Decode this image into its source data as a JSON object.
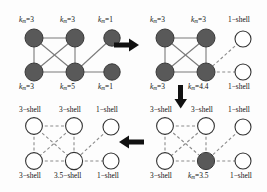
{
  "figure": {
    "width": 267,
    "height": 192,
    "colors": {
      "node_filled": "#595959",
      "node_open_fill": "#ffffff",
      "node_stroke": "#333333",
      "edge_solid": "#7a7a7a",
      "edge_dashed": "#8c8c8c",
      "arrow": "#111111",
      "text": "#111111",
      "background": "#fdfdfd"
    }
  },
  "panels": [
    {
      "id": "panel-top-left",
      "position": "top-left",
      "nodes": [
        {
          "id": "tl-n1",
          "pos": "top-left",
          "state": "filled",
          "label": "k_m=3",
          "label_side": "above"
        },
        {
          "id": "tl-n2",
          "pos": "top-middle",
          "state": "filled",
          "label": "k_m=3",
          "label_side": "above"
        },
        {
          "id": "tl-n3",
          "pos": "top-right",
          "state": "filled",
          "label": "k_m=1",
          "label_side": "above"
        },
        {
          "id": "tl-n4",
          "pos": "bottom-left",
          "state": "filled",
          "label": "k_m=3",
          "label_side": "below"
        },
        {
          "id": "tl-n5",
          "pos": "bottom-middle",
          "state": "filled",
          "label": "k_m=5",
          "label_side": "below"
        },
        {
          "id": "tl-n6",
          "pos": "bottom-right",
          "state": "filled",
          "label": "k_m=1",
          "label_side": "below"
        }
      ],
      "labels": {
        "top_left": "k",
        "top_left_sub": "m",
        "top_left_val": "=3",
        "top_mid": "k",
        "top_mid_sub": "m",
        "top_mid_val": "=3",
        "top_right": "k",
        "top_right_sub": "m",
        "top_right_val": "=1",
        "bot_left": "k",
        "bot_left_sub": "m",
        "bot_left_val": "=3",
        "bot_mid": "k",
        "bot_mid_sub": "m",
        "bot_mid_val": "=5",
        "bot_right": "k",
        "bot_right_sub": "m",
        "bot_right_val": "=1"
      },
      "edges": [
        [
          "tl-n1",
          "tl-n2",
          "solid"
        ],
        [
          "tl-n1",
          "tl-n4",
          "solid"
        ],
        [
          "tl-n1",
          "tl-n5",
          "solid"
        ],
        [
          "tl-n2",
          "tl-n4",
          "solid"
        ],
        [
          "tl-n2",
          "tl-n5",
          "solid"
        ],
        [
          "tl-n4",
          "tl-n5",
          "solid"
        ],
        [
          "tl-n3",
          "tl-n5",
          "solid"
        ],
        [
          "tl-n5",
          "tl-n6",
          "solid"
        ]
      ]
    },
    {
      "id": "panel-top-right",
      "position": "top-right",
      "nodes": [
        {
          "id": "tr-n1",
          "pos": "top-left",
          "state": "filled",
          "label": "k_m=3",
          "label_side": "above"
        },
        {
          "id": "tr-n2",
          "pos": "top-middle",
          "state": "filled",
          "label": "k_m=3",
          "label_side": "above"
        },
        {
          "id": "tr-n3",
          "pos": "top-right",
          "state": "open",
          "label": "1-shell",
          "label_side": "above"
        },
        {
          "id": "tr-n4",
          "pos": "bottom-left",
          "state": "filled",
          "label": "k_m=3",
          "label_side": "below"
        },
        {
          "id": "tr-n5",
          "pos": "bottom-middle",
          "state": "filled",
          "label": "k_m=4.4",
          "label_side": "below"
        },
        {
          "id": "tr-n6",
          "pos": "bottom-right",
          "state": "open",
          "label": "1-shell",
          "label_side": "below"
        }
      ],
      "labels": {
        "top_left": "k",
        "top_left_sub": "m",
        "top_left_val": "=3",
        "top_mid": "k",
        "top_mid_sub": "m",
        "top_mid_val": "=3",
        "top_right": "1−shell",
        "bot_left": "k",
        "bot_left_sub": "m",
        "bot_left_val": "=3",
        "bot_mid": "k",
        "bot_mid_sub": "m",
        "bot_mid_val": "=4.4",
        "bot_right": "1−shell"
      },
      "edges": [
        [
          "tr-n1",
          "tr-n2",
          "solid"
        ],
        [
          "tr-n1",
          "tr-n4",
          "solid"
        ],
        [
          "tr-n1",
          "tr-n5",
          "solid"
        ],
        [
          "tr-n2",
          "tr-n4",
          "solid"
        ],
        [
          "tr-n2",
          "tr-n5",
          "solid"
        ],
        [
          "tr-n4",
          "tr-n5",
          "solid"
        ],
        [
          "tr-n3",
          "tr-n5",
          "dashed"
        ],
        [
          "tr-n5",
          "tr-n6",
          "dashed"
        ]
      ]
    },
    {
      "id": "panel-bottom-right",
      "position": "bottom-right",
      "nodes": [
        {
          "id": "br-n1",
          "pos": "top-left",
          "state": "open",
          "label": "3-shell",
          "label_side": "above"
        },
        {
          "id": "br-n2",
          "pos": "top-middle",
          "state": "open",
          "label": "3-shell",
          "label_side": "above"
        },
        {
          "id": "br-n3",
          "pos": "top-right",
          "state": "open",
          "label": "1-shell",
          "label_side": "above"
        },
        {
          "id": "br-n4",
          "pos": "bottom-left",
          "state": "open",
          "label": "3-shell",
          "label_side": "below"
        },
        {
          "id": "br-n5",
          "pos": "bottom-middle",
          "state": "filled",
          "label": "k_m=3.5",
          "label_side": "below"
        },
        {
          "id": "br-n6",
          "pos": "bottom-right",
          "state": "open",
          "label": "1-shell",
          "label_side": "below"
        }
      ],
      "labels": {
        "top_left": "3−shell",
        "top_mid": "3−shell",
        "top_right": "1−shell",
        "bot_left": "3−shell",
        "bot_mid": "k",
        "bot_mid_sub": "m",
        "bot_mid_val": "=3.5",
        "bot_right": "1−shell"
      },
      "edges": [
        [
          "br-n1",
          "br-n2",
          "dashed"
        ],
        [
          "br-n1",
          "br-n4",
          "dashed"
        ],
        [
          "br-n1",
          "br-n5",
          "dashed"
        ],
        [
          "br-n2",
          "br-n4",
          "dashed"
        ],
        [
          "br-n2",
          "br-n5",
          "dashed"
        ],
        [
          "br-n4",
          "br-n5",
          "dashed"
        ],
        [
          "br-n3",
          "br-n5",
          "dashed"
        ],
        [
          "br-n5",
          "br-n6",
          "dashed"
        ]
      ]
    },
    {
      "id": "panel-bottom-left",
      "position": "bottom-left",
      "nodes": [
        {
          "id": "bl-n1",
          "pos": "top-left",
          "state": "open",
          "label": "3-shell",
          "label_side": "above"
        },
        {
          "id": "bl-n2",
          "pos": "top-middle",
          "state": "open",
          "label": "3-shell",
          "label_side": "above"
        },
        {
          "id": "bl-n3",
          "pos": "top-right",
          "state": "open",
          "label": "1-shell",
          "label_side": "above"
        },
        {
          "id": "bl-n4",
          "pos": "bottom-left",
          "state": "open",
          "label": "3-shell",
          "label_side": "below"
        },
        {
          "id": "bl-n5",
          "pos": "bottom-middle",
          "state": "open",
          "label": "3.5-shell",
          "label_side": "below"
        },
        {
          "id": "bl-n6",
          "pos": "bottom-right",
          "state": "open",
          "label": "1-shell",
          "label_side": "below"
        }
      ],
      "labels": {
        "top_left": "3−shell",
        "top_mid": "3−shell",
        "top_right": "1−shell",
        "bot_left": "3−shell",
        "bot_mid": "3.5−shell",
        "bot_right": "1−shell"
      },
      "edges": [
        [
          "bl-n1",
          "bl-n2",
          "dashed"
        ],
        [
          "bl-n1",
          "bl-n4",
          "dashed"
        ],
        [
          "bl-n1",
          "bl-n5",
          "dashed"
        ],
        [
          "bl-n2",
          "bl-n4",
          "dashed"
        ],
        [
          "bl-n2",
          "bl-n5",
          "dashed"
        ],
        [
          "bl-n4",
          "bl-n5",
          "dashed"
        ],
        [
          "bl-n3",
          "bl-n5",
          "dashed"
        ],
        [
          "bl-n5",
          "bl-n6",
          "dashed"
        ]
      ]
    }
  ],
  "arrows": [
    {
      "id": "arrow-right",
      "direction": "right",
      "from": "panel-top-left",
      "to": "panel-top-right"
    },
    {
      "id": "arrow-down",
      "direction": "down",
      "from": "panel-top-right",
      "to": "panel-bottom-right"
    },
    {
      "id": "arrow-left",
      "direction": "left",
      "from": "panel-bottom-right",
      "to": "panel-bottom-left"
    }
  ]
}
